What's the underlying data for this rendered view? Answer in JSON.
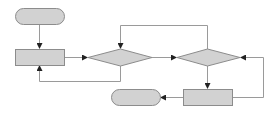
{
  "diagram": {
    "type": "flowchart",
    "colors": {
      "fill": "#d2d2d2",
      "stroke": "#8c8c8c",
      "line": "#9a9a9a",
      "arrow": "#222222",
      "background": "#ffffff"
    },
    "nodes": [
      {
        "id": "start",
        "shape": "terminator",
        "label": "",
        "x": 15,
        "y": 8,
        "w": 49,
        "h": 16
      },
      {
        "id": "process1",
        "shape": "rectangle",
        "label": "",
        "x": 15,
        "y": 49,
        "w": 49,
        "h": 16
      },
      {
        "id": "decision1",
        "shape": "diamond",
        "label": "",
        "cx": 120,
        "cy": 57,
        "w": 64,
        "h": 17
      },
      {
        "id": "decision2",
        "shape": "diamond",
        "label": "",
        "cx": 208,
        "cy": 57,
        "w": 63,
        "h": 17
      },
      {
        "id": "process2",
        "shape": "rectangle",
        "label": "",
        "x": 183,
        "y": 89,
        "w": 49,
        "h": 16
      },
      {
        "id": "end",
        "shape": "terminator",
        "label": "",
        "x": 111,
        "y": 89,
        "w": 49,
        "h": 16
      }
    ],
    "edges": [
      {
        "from": "start",
        "to": "process1",
        "label": ""
      },
      {
        "from": "process1",
        "to": "decision1",
        "label": ""
      },
      {
        "from": "decision1",
        "to": "process1",
        "label": "",
        "route": "loop-below"
      },
      {
        "from": "decision1",
        "to": "decision2",
        "label": ""
      },
      {
        "from": "decision2",
        "to": "decision1",
        "label": "",
        "route": "loop-above"
      },
      {
        "from": "decision2",
        "to": "process2",
        "label": ""
      },
      {
        "from": "process2",
        "to": "decision2",
        "label": "",
        "route": "loop-right"
      },
      {
        "from": "process2",
        "to": "end",
        "label": ""
      }
    ]
  }
}
